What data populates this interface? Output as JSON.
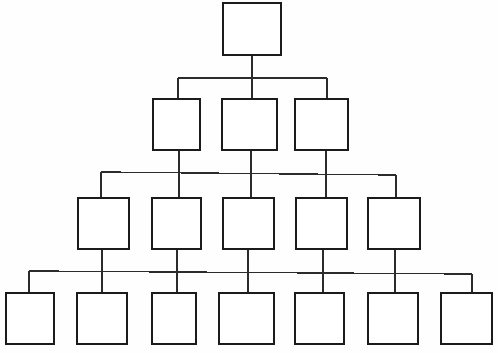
{
  "diagram": {
    "type": "organizational-tree",
    "canvas": {
      "width": 498,
      "height": 353
    },
    "style": {
      "background_color": "#fefefe",
      "box_fill_color": "#ffffff",
      "box_stroke_color": "#1b1b1b",
      "connector_color": "#2b2b2b",
      "box_stroke_width": 1.6,
      "connector_stroke_width": 1.4
    },
    "levels": [
      {
        "level": 1,
        "name": "root-level",
        "node_count": 1,
        "nodes": [
          {
            "id": "n1-1",
            "label": "",
            "x": 223,
            "y": 3,
            "w": 58,
            "h": 52
          }
        ]
      },
      {
        "level": 2,
        "name": "second-level",
        "node_count": 3,
        "nodes": [
          {
            "id": "n2-1",
            "label": "",
            "x": 153,
            "y": 99,
            "w": 47,
            "h": 51
          },
          {
            "id": "n2-2",
            "label": "",
            "x": 222,
            "y": 99,
            "w": 55,
            "h": 51
          },
          {
            "id": "n2-3",
            "label": "",
            "x": 295,
            "y": 99,
            "w": 53,
            "h": 51
          }
        ]
      },
      {
        "level": 3,
        "name": "third-level",
        "node_count": 5,
        "nodes": [
          {
            "id": "n3-1",
            "label": "",
            "x": 78,
            "y": 198,
            "w": 51,
            "h": 51
          },
          {
            "id": "n3-2",
            "label": "",
            "x": 152,
            "y": 198,
            "w": 49,
            "h": 51
          },
          {
            "id": "n3-3",
            "label": "",
            "x": 223,
            "y": 198,
            "w": 51,
            "h": 51
          },
          {
            "id": "n3-4",
            "label": "",
            "x": 296,
            "y": 198,
            "w": 51,
            "h": 51
          },
          {
            "id": "n3-5",
            "label": "",
            "x": 368,
            "y": 198,
            "w": 52,
            "h": 51
          }
        ]
      },
      {
        "level": 4,
        "name": "leaf-level",
        "node_count": 7,
        "nodes": [
          {
            "id": "n4-1",
            "label": "",
            "x": 6,
            "y": 293,
            "w": 48,
            "h": 51
          },
          {
            "id": "n4-2",
            "label": "",
            "x": 77,
            "y": 293,
            "w": 50,
            "h": 51
          },
          {
            "id": "n4-3",
            "label": "",
            "x": 152,
            "y": 293,
            "w": 44,
            "h": 51
          },
          {
            "id": "n4-4",
            "label": "",
            "x": 219,
            "y": 293,
            "w": 55,
            "h": 51
          },
          {
            "id": "n4-5",
            "label": "",
            "x": 295,
            "y": 293,
            "w": 49,
            "h": 51
          },
          {
            "id": "n4-6",
            "label": "",
            "x": 368,
            "y": 293,
            "w": 50,
            "h": 51
          },
          {
            "id": "n4-7",
            "label": "",
            "x": 441,
            "y": 293,
            "w": 51,
            "h": 51
          }
        ]
      }
    ],
    "connectors": [
      {
        "id": "c-root-stem",
        "type": "vertical",
        "x1": 252,
        "y1": 55,
        "x2": 252,
        "y2": 99
      },
      {
        "id": "c-bar-level2",
        "type": "horizontal",
        "x1": 178,
        "y1": 78,
        "x2": 327,
        "y2": 78
      },
      {
        "id": "c-drop-l2-a",
        "type": "vertical",
        "x1": 178,
        "y1": 78,
        "x2": 178,
        "y2": 99
      },
      {
        "id": "c-drop-l2-c",
        "type": "vertical",
        "x1": 327,
        "y1": 78,
        "x2": 327,
        "y2": 99
      },
      {
        "id": "c-stem-n2-1",
        "type": "vertical",
        "x1": 179,
        "y1": 150,
        "x2": 179,
        "y2": 198
      },
      {
        "id": "c-stem-n2-2",
        "type": "vertical",
        "x1": 251,
        "y1": 150,
        "x2": 251,
        "y2": 198
      },
      {
        "id": "c-stem-n2-3",
        "type": "vertical",
        "x1": 326,
        "y1": 150,
        "x2": 326,
        "y2": 198
      },
      {
        "id": "c-bar-level3",
        "type": "horizontal",
        "x1": 101,
        "y1": 172,
        "x2": 396,
        "y2": 175
      },
      {
        "id": "c-drop-l3-left",
        "type": "vertical",
        "x1": 101,
        "y1": 172,
        "x2": 101,
        "y2": 198
      },
      {
        "id": "c-drop-l3-right",
        "type": "vertical",
        "x1": 396,
        "y1": 175,
        "x2": 396,
        "y2": 198
      },
      {
        "id": "c-stem-n3-1",
        "type": "vertical",
        "x1": 102,
        "y1": 249,
        "x2": 102,
        "y2": 293
      },
      {
        "id": "c-stem-n3-2",
        "type": "vertical",
        "x1": 177,
        "y1": 249,
        "x2": 177,
        "y2": 293
      },
      {
        "id": "c-stem-n3-3",
        "type": "vertical",
        "x1": 248,
        "y1": 249,
        "x2": 248,
        "y2": 293
      },
      {
        "id": "c-stem-n3-4",
        "type": "vertical",
        "x1": 323,
        "y1": 249,
        "x2": 323,
        "y2": 293
      },
      {
        "id": "c-stem-n3-5",
        "type": "vertical",
        "x1": 395,
        "y1": 249,
        "x2": 395,
        "y2": 293
      },
      {
        "id": "c-bar-level4",
        "type": "horizontal",
        "x1": 29,
        "y1": 271,
        "x2": 472,
        "y2": 274
      },
      {
        "id": "c-drop-l4-left",
        "type": "vertical",
        "x1": 29,
        "y1": 271,
        "x2": 29,
        "y2": 293
      },
      {
        "id": "c-drop-l4-right",
        "type": "vertical",
        "x1": 472,
        "y1": 274,
        "x2": 472,
        "y2": 293
      }
    ]
  }
}
